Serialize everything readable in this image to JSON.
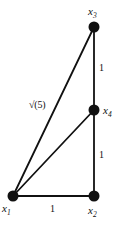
{
  "figure": {
    "type": "graph-diagram",
    "background_color": "#ffffff",
    "stroke_color": "#111111",
    "node_fill_color": "#111111",
    "width": 122,
    "height": 229,
    "nodes": [
      {
        "id": "x1",
        "label": "x",
        "sub": "1",
        "cx": 13,
        "cy": 196,
        "r": 5.5
      },
      {
        "id": "x2",
        "label": "x",
        "sub": "2",
        "cx": 94,
        "cy": 196,
        "r": 5.5
      },
      {
        "id": "x3",
        "label": "x",
        "sub": "3",
        "cx": 94,
        "cy": 27,
        "r": 5.5
      },
      {
        "id": "x4",
        "label": "x",
        "sub": "4",
        "cx": 94,
        "cy": 110,
        "r": 5.5
      }
    ],
    "edges": [
      {
        "id": "e-x1-x2",
        "from": "x1",
        "to": "x2",
        "label": "1"
      },
      {
        "id": "e-x2-x4",
        "from": "x2",
        "to": "x4",
        "label": "1"
      },
      {
        "id": "e-x4-x3",
        "from": "x4",
        "to": "x3",
        "label": "1"
      },
      {
        "id": "e-x1-x4",
        "from": "x1",
        "to": "x4",
        "label": ""
      },
      {
        "id": "e-x1-x3",
        "from": "x1",
        "to": "x3",
        "label": "√(5)"
      }
    ]
  }
}
